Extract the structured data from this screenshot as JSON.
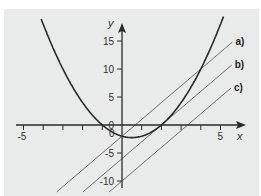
{
  "chart_data": {
    "type": "line",
    "title": "",
    "xlabel": "x",
    "ylabel": "y",
    "xlim": [
      -5.2,
      6.2
    ],
    "ylim": [
      -11,
      18.5
    ],
    "x_ticks": [
      -5,
      -4,
      -3,
      -2,
      -1,
      0,
      1,
      2,
      3,
      4,
      5
    ],
    "x_tick_labels": [
      "-5",
      "0",
      "5"
    ],
    "y_ticks": [
      -10,
      -5,
      0,
      5,
      10,
      15
    ],
    "y_tick_labels": [
      "-10",
      "-5",
      "0",
      "5",
      "10",
      "15"
    ],
    "origin_label": "0",
    "grid": false,
    "series": [
      {
        "name": "parabola",
        "equation": "y = x^2 - x - 2",
        "color": "#2a2a2a"
      },
      {
        "name": "a)",
        "equation": "y = 3x - 2",
        "color": "#6e6e6e"
      },
      {
        "name": "b)",
        "equation": "y = 3x - 6",
        "color": "#6e6e6e"
      },
      {
        "name": "c)",
        "equation": "y = 3x - 10",
        "color": "#6e6e6e"
      }
    ],
    "legend": {
      "position": "right",
      "entries": [
        "a)",
        "b)",
        "c)"
      ]
    }
  },
  "colors": {
    "background": "#e9eaea",
    "axis": "#2a2a2a",
    "lines": "#6e6e6e"
  }
}
